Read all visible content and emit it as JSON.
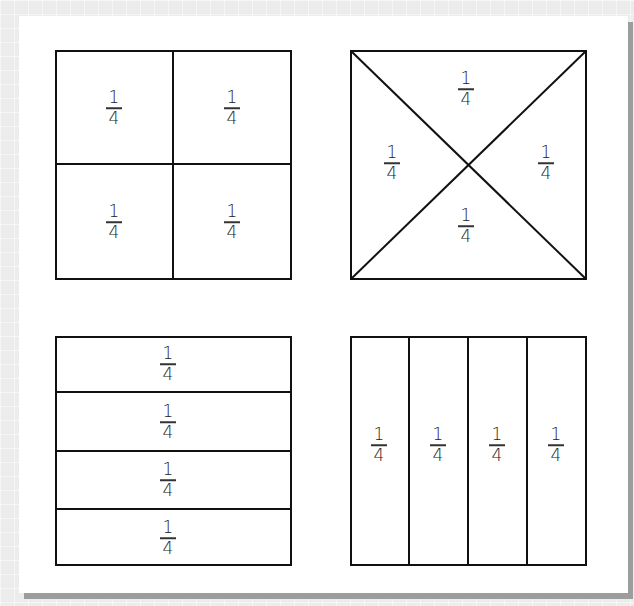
{
  "page": {
    "background_color": "#ececec",
    "card_color": "#ffffff",
    "line_color": "#111111"
  },
  "figures": [
    {
      "id": "square-grid-quarters",
      "description": "Square divided into 2x2 grid of quarters",
      "parts": [
        {
          "numerator": "1",
          "denominator": "4"
        },
        {
          "numerator": "1",
          "denominator": "4"
        },
        {
          "numerator": "1",
          "denominator": "4"
        },
        {
          "numerator": "1",
          "denominator": "4"
        }
      ]
    },
    {
      "id": "square-diagonal-quarters",
      "description": "Square divided by both diagonals into four triangles",
      "parts": [
        {
          "numerator": "1",
          "denominator": "4"
        },
        {
          "numerator": "1",
          "denominator": "4"
        },
        {
          "numerator": "1",
          "denominator": "4"
        },
        {
          "numerator": "1",
          "denominator": "4"
        }
      ]
    },
    {
      "id": "square-row-quarters",
      "description": "Square divided into four horizontal strips",
      "parts": [
        {
          "numerator": "1",
          "denominator": "4"
        },
        {
          "numerator": "1",
          "denominator": "4"
        },
        {
          "numerator": "1",
          "denominator": "4"
        },
        {
          "numerator": "1",
          "denominator": "4"
        }
      ]
    },
    {
      "id": "square-column-quarters",
      "description": "Square divided into four vertical strips",
      "parts": [
        {
          "numerator": "1",
          "denominator": "4"
        },
        {
          "numerator": "1",
          "denominator": "4"
        },
        {
          "numerator": "1",
          "denominator": "4"
        },
        {
          "numerator": "1",
          "denominator": "4"
        }
      ]
    }
  ]
}
